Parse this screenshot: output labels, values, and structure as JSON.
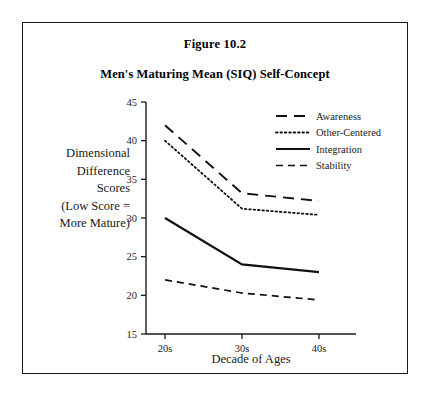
{
  "figure": {
    "number": "Figure 10.2",
    "title": "Men's Maturing Mean (SIQ) Self-Concept"
  },
  "axis": {
    "x_label": "Decade of Ages",
    "y_label_lines": [
      "Dimensional",
      "Difference",
      "Scores",
      "(Low Score =",
      "More Mature)"
    ],
    "y_ticks": [
      "45",
      "40",
      "35",
      "30",
      "25",
      "20",
      "15"
    ],
    "x_ticks": [
      "20s",
      "30s",
      "40s"
    ]
  },
  "legend": {
    "items": [
      {
        "label": "Awareness",
        "style": "long-dash"
      },
      {
        "label": "Other-Centered",
        "style": "dotted"
      },
      {
        "label": "Integration",
        "style": "solid"
      },
      {
        "label": "Stability",
        "style": "dashed"
      }
    ]
  },
  "colors": {
    "line": "#111111",
    "frame": "#1a1a1a",
    "background": "#ffffff"
  },
  "chart_data": {
    "type": "line",
    "title": "Men's Maturing Mean (SIQ) Self-Concept",
    "subtitle": "Figure 10.2",
    "xlabel": "Decade of Ages",
    "ylabel": "Dimensional Difference Scores (Low Score = More Mature)",
    "categories": [
      "20s",
      "30s",
      "40s"
    ],
    "ylim": [
      15,
      45
    ],
    "ytick_step": 5,
    "grid": false,
    "legend_position": "top-right",
    "series": [
      {
        "name": "Awareness",
        "style": "long-dash",
        "values": [
          42.0,
          33.2,
          32.2
        ]
      },
      {
        "name": "Other-Centered",
        "style": "dotted",
        "values": [
          40.0,
          31.2,
          30.4
        ]
      },
      {
        "name": "Integration",
        "style": "solid",
        "values": [
          30.0,
          24.0,
          23.0
        ]
      },
      {
        "name": "Stability",
        "style": "dashed",
        "values": [
          22.0,
          20.3,
          19.4
        ]
      }
    ]
  }
}
